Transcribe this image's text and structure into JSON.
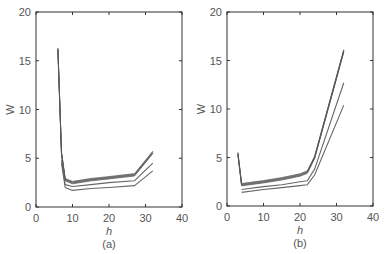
{
  "chart_data": [
    {
      "type": "line",
      "panel": "(a)",
      "caption": "(a)",
      "title": "",
      "xlabel": "h",
      "ylabel": "W",
      "xlim": [
        0,
        40
      ],
      "ylim": [
        0,
        20
      ],
      "xticks": [
        0,
        10,
        20,
        30,
        40
      ],
      "yticks": [
        0,
        5,
        10,
        15,
        20
      ],
      "grid": false,
      "legend": null,
      "series": [
        {
          "name": "bundle-upper (thick, many overlapping curves)",
          "x": [
            6,
            7,
            8,
            10,
            15,
            20,
            27,
            32
          ],
          "y": [
            16.2,
            5.5,
            2.8,
            2.5,
            2.8,
            3.0,
            3.3,
            5.6
          ]
        },
        {
          "name": "curve-middle",
          "x": [
            7,
            8,
            10,
            15,
            20,
            27,
            32
          ],
          "y": [
            4.8,
            2.3,
            2.1,
            2.3,
            2.5,
            2.7,
            4.5
          ]
        },
        {
          "name": "curve-lower",
          "x": [
            7,
            8,
            10,
            15,
            20,
            27,
            32
          ],
          "y": [
            4.5,
            2.0,
            1.7,
            1.9,
            2.0,
            2.2,
            3.7
          ]
        }
      ]
    },
    {
      "type": "line",
      "panel": "(b)",
      "caption": "(b)",
      "title": "",
      "xlabel": "h",
      "ylabel": "W",
      "xlim": [
        0,
        40
      ],
      "ylim": [
        0,
        20
      ],
      "xticks": [
        0,
        10,
        20,
        30,
        40
      ],
      "yticks": [
        0,
        5,
        10,
        15,
        20
      ],
      "grid": false,
      "legend": null,
      "series": [
        {
          "name": "bundle-upper (thick, many overlapping curves)",
          "x": [
            3,
            4,
            10,
            15,
            20,
            22,
            24,
            32
          ],
          "y": [
            5.4,
            2.2,
            2.5,
            2.8,
            3.2,
            3.5,
            5.0,
            16.0
          ]
        },
        {
          "name": "curve-middle",
          "x": [
            4,
            10,
            15,
            20,
            22,
            24,
            32
          ],
          "y": [
            1.7,
            2.0,
            2.2,
            2.5,
            2.6,
            3.8,
            12.7
          ]
        },
        {
          "name": "curve-lower",
          "x": [
            4,
            10,
            15,
            20,
            22,
            24,
            32
          ],
          "y": [
            1.4,
            1.7,
            1.9,
            2.1,
            2.2,
            3.2,
            10.4
          ]
        }
      ]
    }
  ],
  "panels": [
    {
      "caption": "(a)",
      "xlabel": "h",
      "ylabel": "W",
      "xtick_labels": [
        "0",
        "10",
        "20",
        "30",
        "40"
      ],
      "ytick_labels": [
        "0",
        "5",
        "10",
        "15",
        "20"
      ]
    },
    {
      "caption": "(b)",
      "xlabel": "h",
      "ylabel": "W",
      "xtick_labels": [
        "0",
        "10",
        "20",
        "30",
        "40"
      ],
      "ytick_labels": [
        "0",
        "5",
        "10",
        "15",
        "20"
      ]
    }
  ],
  "colors": {
    "axis": "#333333",
    "bundle": "#555555",
    "line": "#666666",
    "text": "#555555"
  }
}
